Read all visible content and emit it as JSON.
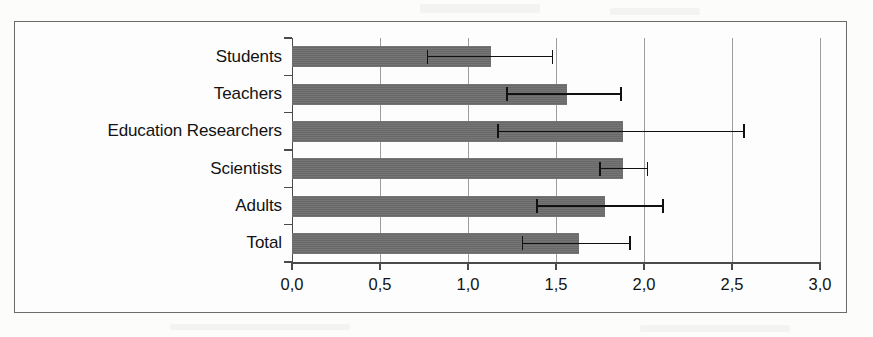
{
  "figure": {
    "type": "horizontal-bar-with-error-bars",
    "frame_visible": true,
    "background_color": "#fdfdfd",
    "bar_color": "#6e6e6e",
    "grid_color": "#9d9d9d",
    "error_bar_color": "#111111"
  },
  "chart_data": {
    "type": "bar",
    "orientation": "horizontal",
    "title": "",
    "subtitle": "",
    "xlabel": "",
    "ylabel": "",
    "categories": [
      "Students",
      "Teachers",
      "Education Researchers",
      "Scientists",
      "Adults",
      "Total"
    ],
    "values": [
      1.13,
      1.56,
      1.88,
      1.88,
      1.78,
      1.63
    ],
    "error_low": [
      0.77,
      1.22,
      1.17,
      1.75,
      1.39,
      1.31
    ],
    "error_high": [
      1.48,
      1.87,
      2.57,
      2.02,
      2.11,
      1.92
    ],
    "xlim": [
      0.0,
      3.0
    ],
    "xticks": [
      0.0,
      0.5,
      1.0,
      1.5,
      2.0,
      2.5,
      3.0
    ],
    "xtick_labels": [
      "0,0",
      "0,5",
      "1,0",
      "1,5",
      "2,0",
      "2,5",
      "3,0"
    ],
    "grid": true,
    "grid_axis": "x",
    "legend": null,
    "legend_position": "none",
    "annotations": [],
    "decimal_separator": ",",
    "series": [
      {
        "name": "Mean",
        "values": [
          1.13,
          1.56,
          1.88,
          1.88,
          1.78,
          1.63
        ]
      }
    ]
  }
}
